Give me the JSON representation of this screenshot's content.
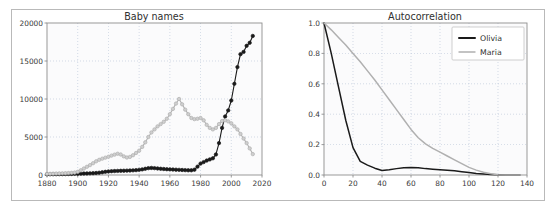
{
  "figure": {
    "background_color": "#ffffff",
    "frame_color": "#b9b9b9"
  },
  "colors": {
    "olivia": "#1a1a1a",
    "maria": "#b0b0b0",
    "grid": "#b9c6d8",
    "axis": "#8e8e8e",
    "text": "#3a3a3a",
    "plot_background": "#fbfbfc"
  },
  "panels": {
    "left": {
      "title": "Baby names",
      "xticks": [
        "1880",
        "1900",
        "1920",
        "1940",
        "1960",
        "1980",
        "2000",
        "2020"
      ],
      "yticks": [
        "0",
        "5000",
        "10000",
        "15000",
        "20000"
      ]
    },
    "right": {
      "title": "Autocorrelation",
      "xticks": [
        "0",
        "20",
        "40",
        "60",
        "80",
        "100",
        "120",
        "140"
      ],
      "yticks": [
        "0.0",
        "0.2",
        "0.4",
        "0.6",
        "0.8",
        "1.0"
      ],
      "legend": [
        {
          "label": "Olivia",
          "color": "#1a1a1a"
        },
        {
          "label": "Maria",
          "color": "#b0b0b0"
        }
      ]
    }
  },
  "chart_data": [
    {
      "type": "line",
      "title": "Baby names",
      "xlabel": "",
      "ylabel": "",
      "xlim": [
        1880,
        2020
      ],
      "ylim": [
        0,
        20000
      ],
      "grid": true,
      "legend_position": "none",
      "markers": "circle",
      "x": [
        1880,
        1882,
        1884,
        1886,
        1888,
        1890,
        1892,
        1894,
        1896,
        1898,
        1900,
        1902,
        1904,
        1906,
        1908,
        1910,
        1912,
        1914,
        1916,
        1918,
        1920,
        1922,
        1924,
        1926,
        1928,
        1930,
        1932,
        1934,
        1936,
        1938,
        1940,
        1942,
        1944,
        1946,
        1948,
        1950,
        1952,
        1954,
        1956,
        1958,
        1960,
        1962,
        1964,
        1966,
        1968,
        1970,
        1972,
        1974,
        1976,
        1978,
        1980,
        1982,
        1984,
        1986,
        1988,
        1990,
        1992,
        1994,
        1996,
        1998,
        2000,
        2002,
        2004,
        2006,
        2008,
        2010,
        2012,
        2014
      ],
      "series": [
        {
          "name": "Olivia",
          "color": "#1a1a1a",
          "values": [
            90,
            95,
            100,
            105,
            110,
            115,
            120,
            130,
            140,
            150,
            160,
            175,
            190,
            205,
            220,
            240,
            265,
            300,
            360,
            420,
            470,
            500,
            520,
            540,
            550,
            560,
            575,
            590,
            610,
            640,
            680,
            740,
            820,
            900,
            930,
            900,
            860,
            820,
            790,
            760,
            740,
            720,
            700,
            680,
            660,
            640,
            620,
            620,
            700,
            1100,
            1500,
            1700,
            1900,
            2050,
            2200,
            2700,
            4200,
            6200,
            7700,
            8500,
            9800,
            12000,
            14200,
            15900,
            16200,
            17000,
            17400,
            18300
          ]
        },
        {
          "name": "Maria",
          "color": "#b0b0b0",
          "values": [
            150,
            160,
            175,
            190,
            205,
            220,
            240,
            260,
            285,
            320,
            420,
            620,
            850,
            1080,
            1300,
            1550,
            1800,
            2000,
            2150,
            2280,
            2400,
            2550,
            2680,
            2800,
            2700,
            2450,
            2300,
            2380,
            2600,
            2900,
            3200,
            3700,
            4300,
            5000,
            5600,
            6000,
            6400,
            6700,
            7000,
            7400,
            8000,
            8700,
            9400,
            10000,
            9300,
            8600,
            8000,
            7500,
            7350,
            7400,
            7500,
            7200,
            6600,
            6200,
            6000,
            6200,
            6700,
            7100,
            7200,
            7050,
            6800,
            6400,
            6000,
            5400,
            4800,
            4200,
            3500,
            2750
          ]
        }
      ]
    },
    {
      "type": "line",
      "title": "Autocorrelation",
      "xlabel": "",
      "ylabel": "",
      "xlim": [
        0,
        140
      ],
      "ylim": [
        0.0,
        1.0
      ],
      "grid": true,
      "legend_position": "upper right",
      "markers": "none",
      "x": [
        0,
        5,
        10,
        15,
        20,
        25,
        30,
        35,
        40,
        45,
        50,
        55,
        60,
        65,
        70,
        75,
        80,
        85,
        90,
        95,
        100,
        105,
        110,
        115,
        120,
        125,
        130,
        135
      ],
      "series": [
        {
          "name": "Olivia",
          "color": "#1a1a1a",
          "values": [
            1.0,
            0.8,
            0.58,
            0.36,
            0.18,
            0.09,
            0.065,
            0.045,
            0.03,
            0.035,
            0.042,
            0.048,
            0.05,
            0.048,
            0.042,
            0.038,
            0.035,
            0.032,
            0.028,
            0.022,
            0.016,
            0.01,
            0.006,
            0.003,
            0.001,
            0.0,
            0.0,
            0.0
          ]
        },
        {
          "name": "Maria",
          "color": "#b0b0b0",
          "values": [
            1.0,
            0.955,
            0.905,
            0.855,
            0.8,
            0.745,
            0.685,
            0.625,
            0.56,
            0.495,
            0.43,
            0.365,
            0.3,
            0.245,
            0.205,
            0.175,
            0.15,
            0.125,
            0.1,
            0.075,
            0.05,
            0.032,
            0.018,
            0.008,
            0.002,
            0.0,
            0.0,
            0.0
          ]
        }
      ]
    }
  ]
}
